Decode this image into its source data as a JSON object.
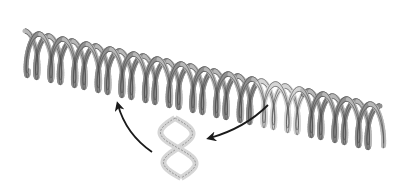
{
  "diagram": {
    "type": "dna-double-helix-segment-transposition",
    "background": "#ffffff",
    "helix": {
      "start": [
        25,
        35
      ],
      "end": [
        380,
        110
      ],
      "radius": 22,
      "turns": 15,
      "ribbon_color": "#b8b8b8",
      "ribbon_dark": "#8f8f8f",
      "outline": "#444444"
    },
    "highlighted_segment": {
      "style": "dashed-light",
      "color": "#d6d6d6",
      "x_range": [
        258,
        302
      ]
    },
    "detached_segment": {
      "center": [
        178,
        148
      ],
      "style": "dashed-light",
      "color": "#d6d6d6"
    },
    "arrows": [
      {
        "name": "arrow-from-helix-to-segment",
        "from": [
          268,
          105
        ],
        "to": [
          208,
          138
        ],
        "color": "#1a1a1a"
      },
      {
        "name": "arrow-from-segment-to-helix",
        "from": [
          152,
          152
        ],
        "to": [
          118,
          103
        ],
        "color": "#1a1a1a"
      }
    ]
  }
}
